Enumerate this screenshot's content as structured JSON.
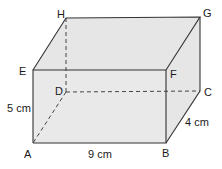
{
  "diagram": {
    "type": "cuboid",
    "vertices": {
      "A": "A",
      "B": "B",
      "C": "C",
      "D": "D",
      "E": "E",
      "F": "F",
      "G": "G",
      "H": "H"
    },
    "dimensions": {
      "height": "5 cm",
      "length": "9 cm",
      "width": "4 cm"
    },
    "colors": {
      "face_fill": "#e8e8e8",
      "edge": "#333333"
    }
  }
}
